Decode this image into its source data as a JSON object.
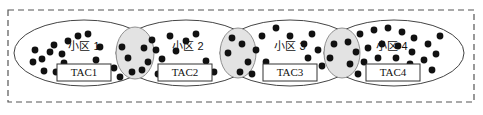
{
  "figure": {
    "type": "diagram",
    "outer_boundary": {
      "name": "tracking-area-boundary",
      "style": "dashed",
      "color": "#555555",
      "x": 8,
      "y": 10,
      "width": 466,
      "height": 92
    },
    "colors": {
      "dot": "#111111",
      "ellipse_stroke": "#444444",
      "ellipse_fill": "#ffffff",
      "overlap_fill": "#e3e3e3",
      "overlap_stroke": "#777777",
      "box_stroke": "#333333",
      "dashed_border": "#555555",
      "text": "#111111"
    },
    "cells": [
      {
        "id": "cell-1",
        "label": "小区 1",
        "tac_label": "TAC1",
        "ellipse": {
          "cx": 84,
          "cy": 53,
          "rx": 70,
          "ry": 33
        },
        "label_pos": {
          "x": 84,
          "y": 50
        },
        "tac_box": {
          "x": 57,
          "y": 64,
          "width": 54,
          "height": 17
        },
        "dots": [
          {
            "x": 42,
            "y": 59
          },
          {
            "x": 54,
            "y": 45
          },
          {
            "x": 50,
            "y": 52
          },
          {
            "x": 35,
            "y": 50
          },
          {
            "x": 62,
            "y": 54
          },
          {
            "x": 68,
            "y": 41
          },
          {
            "x": 78,
            "y": 36
          },
          {
            "x": 88,
            "y": 34
          },
          {
            "x": 44,
            "y": 71
          },
          {
            "x": 56,
            "y": 72
          },
          {
            "x": 33,
            "y": 62
          },
          {
            "x": 64,
            "y": 63
          },
          {
            "x": 96,
            "y": 60
          },
          {
            "x": 114,
            "y": 68
          },
          {
            "x": 100,
            "y": 47
          }
        ]
      },
      {
        "id": "cell-2",
        "label": "小区 2",
        "tac_label": "TAC2",
        "ellipse": {
          "cx": 186,
          "cy": 53,
          "rx": 70,
          "ry": 33
        },
        "label_pos": {
          "x": 188,
          "y": 50
        },
        "tac_box": {
          "x": 158,
          "y": 64,
          "width": 54,
          "height": 17
        },
        "dots": [
          {
            "x": 152,
            "y": 40
          },
          {
            "x": 144,
            "y": 48
          },
          {
            "x": 156,
            "y": 50
          },
          {
            "x": 170,
            "y": 36
          },
          {
            "x": 186,
            "y": 41
          },
          {
            "x": 196,
            "y": 34
          },
          {
            "x": 162,
            "y": 59
          },
          {
            "x": 148,
            "y": 62
          },
          {
            "x": 176,
            "y": 51
          },
          {
            "x": 142,
            "y": 70
          },
          {
            "x": 158,
            "y": 74
          },
          {
            "x": 206,
            "y": 61
          },
          {
            "x": 214,
            "y": 72
          },
          {
            "x": 196,
            "y": 72
          },
          {
            "x": 122,
            "y": 47
          },
          {
            "x": 128,
            "y": 58
          },
          {
            "x": 132,
            "y": 72
          },
          {
            "x": 120,
            "y": 77
          }
        ]
      },
      {
        "id": "cell-3",
        "label": "小区 3",
        "tac_label": "TAC3",
        "ellipse": {
          "cx": 290,
          "cy": 53,
          "rx": 70,
          "ry": 33
        },
        "label_pos": {
          "x": 290,
          "y": 50
        },
        "tac_box": {
          "x": 263,
          "y": 64,
          "width": 54,
          "height": 17
        },
        "dots": [
          {
            "x": 242,
            "y": 44
          },
          {
            "x": 256,
            "y": 50
          },
          {
            "x": 248,
            "y": 62
          },
          {
            "x": 262,
            "y": 36
          },
          {
            "x": 276,
            "y": 28
          },
          {
            "x": 290,
            "y": 36
          },
          {
            "x": 304,
            "y": 44
          },
          {
            "x": 312,
            "y": 34
          },
          {
            "x": 266,
            "y": 62
          },
          {
            "x": 240,
            "y": 72
          },
          {
            "x": 252,
            "y": 74
          },
          {
            "x": 308,
            "y": 58
          },
          {
            "x": 318,
            "y": 50
          },
          {
            "x": 322,
            "y": 66
          },
          {
            "x": 334,
            "y": 44
          },
          {
            "x": 330,
            "y": 58
          },
          {
            "x": 228,
            "y": 53
          },
          {
            "x": 232,
            "y": 38
          }
        ]
      },
      {
        "id": "cell-4",
        "label": "小区 4",
        "tac_label": "TAC4",
        "ellipse": {
          "cx": 394,
          "cy": 53,
          "rx": 70,
          "ry": 33
        },
        "label_pos": {
          "x": 392,
          "y": 50
        },
        "tac_box": {
          "x": 366,
          "y": 64,
          "width": 54,
          "height": 17
        },
        "dots": [
          {
            "x": 348,
            "y": 42
          },
          {
            "x": 360,
            "y": 34
          },
          {
            "x": 374,
            "y": 30
          },
          {
            "x": 388,
            "y": 28
          },
          {
            "x": 402,
            "y": 32
          },
          {
            "x": 414,
            "y": 38
          },
          {
            "x": 356,
            "y": 52
          },
          {
            "x": 368,
            "y": 48
          },
          {
            "x": 382,
            "y": 44
          },
          {
            "x": 398,
            "y": 46
          },
          {
            "x": 412,
            "y": 52
          },
          {
            "x": 428,
            "y": 44
          },
          {
            "x": 350,
            "y": 64
          },
          {
            "x": 364,
            "y": 62
          },
          {
            "x": 378,
            "y": 58
          },
          {
            "x": 396,
            "y": 58
          },
          {
            "x": 410,
            "y": 64
          },
          {
            "x": 424,
            "y": 60
          },
          {
            "x": 436,
            "y": 54
          },
          {
            "x": 358,
            "y": 74
          },
          {
            "x": 372,
            "y": 72
          },
          {
            "x": 404,
            "y": 74
          },
          {
            "x": 432,
            "y": 70
          },
          {
            "x": 440,
            "y": 36
          }
        ]
      }
    ],
    "overlaps": [
      {
        "id": "overlap-1-2",
        "between": [
          "cell-1",
          "cell-2"
        ],
        "cx": 135,
        "cy": 53,
        "rx": 19,
        "ry": 26
      },
      {
        "id": "overlap-2-3",
        "between": [
          "cell-2",
          "cell-3"
        ],
        "cx": 238,
        "cy": 53,
        "rx": 18,
        "ry": 25
      },
      {
        "id": "overlap-3-4",
        "between": [
          "cell-3",
          "cell-4"
        ],
        "cx": 342,
        "cy": 53,
        "rx": 18,
        "ry": 25
      }
    ]
  }
}
